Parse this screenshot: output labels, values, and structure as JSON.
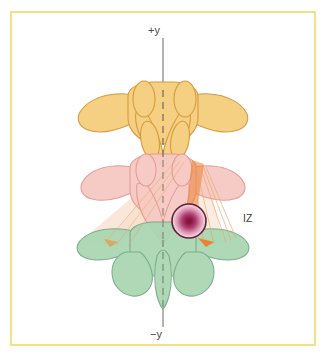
{
  "figure": {
    "frame_color": "#f2e08a",
    "background_color": "#ffffff"
  },
  "axis": {
    "positive_label": "+y",
    "negative_label": "−y",
    "line_color": "#8c8c8c",
    "dashed_color": "#7a7063"
  },
  "annotations": {
    "isocenter_label": "IZ"
  },
  "anatomy": {
    "vertebrae": [
      {
        "name": "superior-vertebra",
        "fill": "#f5cf82",
        "stroke": "#d99a3e"
      },
      {
        "name": "middle-vertebra",
        "fill": "#f7c9c2",
        "stroke": "#e09a93"
      },
      {
        "name": "inferior-vertebra",
        "fill": "#a9d6b2",
        "stroke": "#74a884"
      }
    ]
  },
  "beams": {
    "fill": "#f0a070",
    "accent": "#ef8030",
    "line_color": "#e8a56a"
  },
  "target": {
    "name": "isocenter-dose-sphere",
    "center_color": "#8e1b46",
    "mid_color": "#c4557f",
    "edge_color": "#f0c9d6",
    "ring_color": "#5e2238",
    "center_x": 189,
    "center_y": 221,
    "radius": 17
  }
}
